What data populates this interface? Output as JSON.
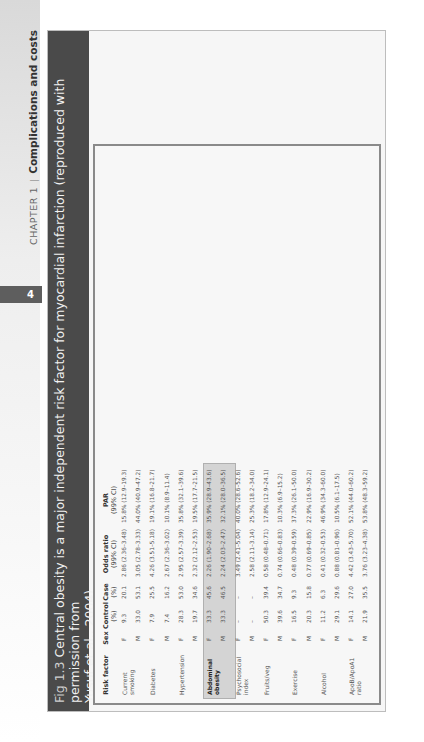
{
  "running_head": {
    "chapter": "CHAPTER 1",
    "title": "Complications and costs",
    "page_number": "4"
  },
  "figure": {
    "number": "Fig 1.3",
    "caption_line1": "Central obesity is a major independent risk factor for myocardial infarction (reproduced with permission from",
    "caption_line2": "Yusuf et al., 2004)"
  },
  "table": {
    "headers": {
      "risk_factor": "Risk factor",
      "sex": "Sex",
      "control": "Control",
      "control_sub": "(%)",
      "case": "Case",
      "case_sub": "(%)",
      "odds_ratio": "Odds ratio",
      "odds_ratio_sub": "(99% CI)",
      "par": "PAR",
      "par_sub": "(99% CI)"
    },
    "groups": [
      {
        "label": "Current smoking"
      },
      {
        "label": "Diabetes"
      },
      {
        "label": "Hypertension"
      },
      {
        "label": "Abdominal obesity"
      },
      {
        "label": "Psychosocial index"
      },
      {
        "label": "Fruits/veg"
      },
      {
        "label": "Exercise"
      },
      {
        "label": "Alcohol"
      },
      {
        "label": "ApoB/ApoA1 ratio"
      }
    ],
    "rows": [
      {
        "sex": "F",
        "control": "9.3",
        "case": "20.1",
        "or": "2.86 (2.36–3.48)",
        "par": "15.8% (12.9–19.3)"
      },
      {
        "sex": "M",
        "control": "33.0",
        "case": "53.1",
        "or": "3.05 (2.78–3.33)",
        "par": "44.0% (40.9–47.2)"
      },
      {
        "sex": "F",
        "control": "7.9",
        "case": "25.5",
        "or": "4.26 (3.51–5.18)",
        "par": "19.1% (16.8–21.7)"
      },
      {
        "sex": "M",
        "control": "7.4",
        "case": "16.2",
        "or": "2.67 (2.36–3.02)",
        "par": "10.1% (8.9–11.4)"
      },
      {
        "sex": "F",
        "control": "28.3",
        "case": "53.0",
        "or": "2.95 (2.57–3.39)",
        "par": "35.8% (32.1–39.6)"
      },
      {
        "sex": "M",
        "control": "19.7",
        "case": "34.6",
        "or": "2.32 (2.12–2.53)",
        "par": "19.5% (17.7–21.5)"
      },
      {
        "sex": "F",
        "control": "33.3",
        "case": "45.6",
        "or": "2.26 (1.90–2.68)",
        "par": "35.9% (28.9–43.6)"
      },
      {
        "sex": "M",
        "control": "33.3",
        "case": "46.5",
        "or": "2.24 (2.03–2.47)",
        "par": "32.1% (28.0–36.5)"
      },
      {
        "sex": "F",
        "control": "–",
        "case": "–",
        "or": "3.49 (2.41–5.04)",
        "par": "40.0% (28.6–52.6)"
      },
      {
        "sex": "M",
        "control": "–",
        "case": "–",
        "or": "2.58 (2.11–3.14)",
        "par": "25.3% (18.2–34.0)"
      },
      {
        "sex": "F",
        "control": "50.3",
        "case": "39.4",
        "or": "0.58 (0.48–0.71)",
        "par": "17.8% (12.9–24.1)"
      },
      {
        "sex": "M",
        "control": "39.6",
        "case": "34.7",
        "or": "0.74 (0.66–0.83)",
        "par": "10.3% (6.9–15.2)"
      },
      {
        "sex": "F",
        "control": "16.5",
        "case": "9.3",
        "or": "0.48 (0.39–0.59)",
        "par": "37.3% (26.1–50.0)"
      },
      {
        "sex": "M",
        "control": "20.3",
        "case": "15.8",
        "or": "0.77 (0.69–0.85)",
        "par": "22.9% (16.9–30.2)"
      },
      {
        "sex": "F",
        "control": "11.2",
        "case": "6.3",
        "or": "0.41 (0.32–0.53)",
        "par": "46.9% (34.3–60.0)"
      },
      {
        "sex": "M",
        "control": "29.1",
        "case": "29.6",
        "or": "0.88 (0.81–0.96)",
        "par": "10.5% (6.1–17.5)"
      },
      {
        "sex": "F",
        "control": "14.1",
        "case": "27.0",
        "or": "4.42 (3.43–5.70)",
        "par": "52.1% (44.0–60.2)"
      },
      {
        "sex": "M",
        "control": "21.9",
        "case": "35.5",
        "or": "3.76 (3.23–4.38)",
        "par": "53.8% (48.3–59.2)"
      }
    ]
  },
  "axis": {
    "title": "Odds ratio (99% CI)",
    "ticks": [
      "0.25",
      "0.5",
      "1",
      "2",
      "4",
      "8",
      "16"
    ]
  },
  "colors": {
    "caption_band": "#4a4a4a",
    "female_marker": "#9a9a9a",
    "male_marker": "#111111",
    "highlight": "#d4d4d4"
  }
}
